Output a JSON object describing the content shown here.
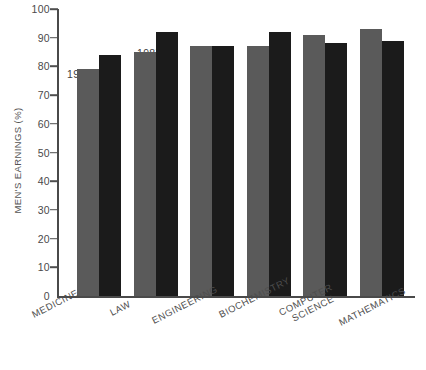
{
  "chart_data": {
    "type": "bar",
    "title": "",
    "subtitle": "",
    "xlabel": "",
    "ylabel": "MEN'S EARNINGS (%)",
    "ylim": [
      0,
      100
    ],
    "ytick_labels": [
      "0",
      "10",
      "20",
      "30",
      "40",
      "50",
      "60",
      "70",
      "80",
      "90",
      "100"
    ],
    "ytick_values": [
      0,
      10,
      20,
      30,
      40,
      50,
      60,
      70,
      80,
      90,
      100
    ],
    "grid": false,
    "legend_position": "inline-annotation",
    "categories": [
      "MEDICINE",
      "LAW",
      "ENGINEERING",
      "BIOCHEMISTRY",
      "COMPUTER SCIENCE",
      "MATHEMATICS"
    ],
    "series": [
      {
        "name": "1984",
        "color": "#5a5a5a",
        "values": [
          79,
          85,
          87,
          87,
          91,
          93
        ]
      },
      {
        "name": "1987",
        "color": "#1b1b1b",
        "values": [
          84,
          92,
          87,
          92,
          88,
          89
        ]
      }
    ],
    "annotations": [
      {
        "text": "1984",
        "series": "1984",
        "category": "MEDICINE"
      },
      {
        "text": "1987",
        "series": "1987",
        "category": "MEDICINE"
      }
    ]
  },
  "axis": {
    "y_title": "MEN'S EARNINGS (%)",
    "y_max": 100,
    "y_min": 0
  },
  "colors": {
    "background": "#ffffff",
    "axis": "#4a4a4a",
    "text": "#4d4d4d",
    "bar_1984": "#5a5a5a",
    "bar_1987": "#1b1b1b"
  }
}
